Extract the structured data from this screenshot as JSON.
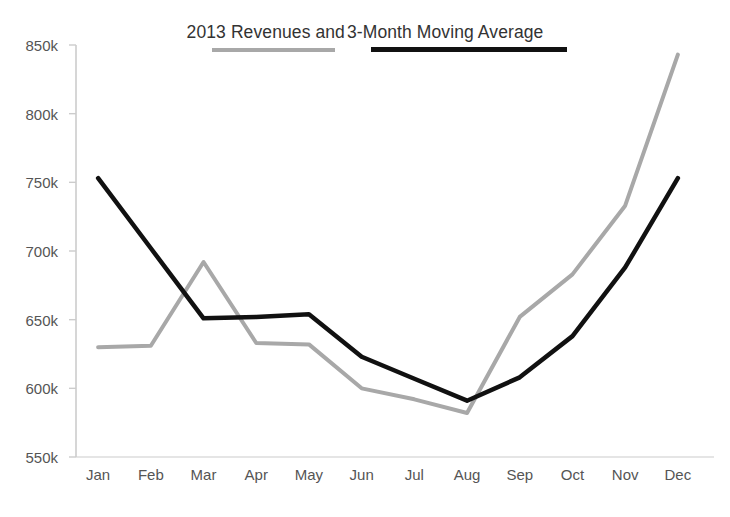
{
  "chart_data": {
    "type": "line",
    "title": "2013 Revenues and 3-Month Moving Average",
    "title_segments": [
      {
        "text": "2013 Revenues and ",
        "rule_color": "#a8a8a8",
        "series": "Revenues"
      },
      {
        "text": "3-Month Moving Average",
        "rule_color": "#111111",
        "series": "3-Month Moving Average"
      }
    ],
    "xlabel": "",
    "ylabel": "",
    "categories": [
      "Jan",
      "Feb",
      "Mar",
      "Apr",
      "May",
      "Jun",
      "Jul",
      "Aug",
      "Sep",
      "Oct",
      "Nov",
      "Dec"
    ],
    "ylim": [
      550000,
      850000
    ],
    "ytick_values": [
      550000,
      600000,
      650000,
      700000,
      750000,
      800000,
      850000
    ],
    "ytick_labels": [
      "550k",
      "600k",
      "650k",
      "700k",
      "750k",
      "800k",
      "850k"
    ],
    "grid": false,
    "legend_position": "inline-title-underline",
    "series": [
      {
        "name": "Revenues",
        "color": "#a8a8a8",
        "width": 4,
        "values": [
          630000,
          631000,
          692000,
          633000,
          632000,
          600000,
          592000,
          582000,
          652000,
          683000,
          733000,
          843000
        ]
      },
      {
        "name": "3-Month Moving Average",
        "color": "#111111",
        "width": 4.5,
        "values": [
          753000,
          702000,
          651000,
          652000,
          654000,
          623000,
          607000,
          591000,
          608000,
          638000,
          688000,
          753000
        ]
      }
    ],
    "axis_color": "#cccccc",
    "tick_text_color": "#555555"
  }
}
